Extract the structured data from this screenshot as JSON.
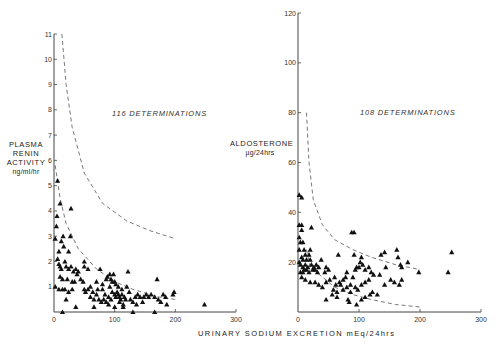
{
  "chart_data": [
    {
      "type": "scatter",
      "title": "",
      "annotation": "116 DETERMINATIONS",
      "xlabel": "URINARY SODIUM EXCRETION mEq/24hrs",
      "ylabel": "PLASMA RENIN ACTIVITY",
      "ylabel_units": "ng/ml/hr",
      "xlim": [
        0,
        300
      ],
      "ylim": [
        0,
        11
      ],
      "xticks": [
        0,
        100,
        200,
        300
      ],
      "yticks": [
        1,
        2,
        3,
        4,
        5,
        6,
        7,
        8,
        9,
        10,
        11
      ],
      "grid": false,
      "marker": "triangle",
      "reference_curves": [
        {
          "name": "upper limit (dashed)",
          "points": [
            [
              13,
              11
            ],
            [
              20,
              9
            ],
            [
              30,
              7.3
            ],
            [
              50,
              5.5
            ],
            [
              80,
              4.3
            ],
            [
              120,
              3.6
            ],
            [
              160,
              3.2
            ],
            [
              200,
              2.9
            ]
          ]
        },
        {
          "name": "lower limit (dashed)",
          "points": [
            [
              2,
              5.8
            ],
            [
              10,
              4.5
            ],
            [
              20,
              3.5
            ],
            [
              40,
              2.5
            ],
            [
              70,
              1.7
            ],
            [
              100,
              1.2
            ],
            [
              130,
              0.9
            ],
            [
              170,
              0.6
            ],
            [
              200,
              0.5
            ]
          ]
        }
      ],
      "series": [
        {
          "name": "determinations",
          "points": [
            [
              6,
              5.2
            ],
            [
              10,
              4.3
            ],
            [
              5,
              3.8
            ],
            [
              28,
              4.1
            ],
            [
              4,
              3.4
            ],
            [
              2,
              2.9
            ],
            [
              15,
              3.0
            ],
            [
              27,
              3.0
            ],
            [
              12,
              2.8
            ],
            [
              16,
              2.6
            ],
            [
              8,
              2.4
            ],
            [
              24,
              2.4
            ],
            [
              6,
              2.1
            ],
            [
              8,
              1.9
            ],
            [
              10,
              1.8
            ],
            [
              12,
              1.7
            ],
            [
              18,
              2.0
            ],
            [
              20,
              1.8
            ],
            [
              24,
              1.7
            ],
            [
              28,
              1.8
            ],
            [
              32,
              1.6
            ],
            [
              36,
              1.7
            ],
            [
              40,
              1.6
            ],
            [
              50,
              2.0
            ],
            [
              50,
              1.8
            ],
            [
              56,
              1.7
            ],
            [
              76,
              1.7
            ],
            [
              122,
              1.6
            ],
            [
              170,
              1.3
            ],
            [
              10,
              1.4
            ],
            [
              14,
              1.3
            ],
            [
              22,
              1.3
            ],
            [
              30,
              1.2
            ],
            [
              34,
              1.2
            ],
            [
              48,
              1.2
            ],
            [
              70,
              1.2
            ],
            [
              80,
              1.1
            ],
            [
              88,
              1.4
            ],
            [
              92,
              1.5
            ],
            [
              94,
              1.3
            ],
            [
              96,
              1.2
            ],
            [
              98,
              1.5
            ],
            [
              100,
              1.2
            ],
            [
              102,
              1.1
            ],
            [
              92,
              1.0
            ],
            [
              86,
              1.3
            ],
            [
              120,
              1.0
            ],
            [
              2,
              1.0
            ],
            [
              8,
              0.9
            ],
            [
              14,
              0.9
            ],
            [
              18,
              0.9
            ],
            [
              24,
              0.8
            ],
            [
              30,
              0.9
            ],
            [
              50,
              0.9
            ],
            [
              52,
              0.8
            ],
            [
              56,
              0.9
            ],
            [
              64,
              0.8
            ],
            [
              70,
              0.7
            ],
            [
              80,
              0.9
            ],
            [
              84,
              0.7
            ],
            [
              90,
              0.6
            ],
            [
              96,
              0.8
            ],
            [
              100,
              0.7
            ],
            [
              102,
              0.6
            ],
            [
              104,
              0.8
            ],
            [
              106,
              0.7
            ],
            [
              108,
              0.6
            ],
            [
              110,
              0.5
            ],
            [
              112,
              0.7
            ],
            [
              116,
              0.6
            ],
            [
              118,
              0.5
            ],
            [
              124,
              0.8
            ],
            [
              126,
              0.5
            ],
            [
              134,
              0.6
            ],
            [
              138,
              0.7
            ],
            [
              142,
              0.6
            ],
            [
              148,
              0.6
            ],
            [
              152,
              0.7
            ],
            [
              156,
              0.6
            ],
            [
              160,
              0.7
            ],
            [
              166,
              0.6
            ],
            [
              172,
              0.5
            ],
            [
              180,
              0.7
            ],
            [
              184,
              0.6
            ],
            [
              196,
              0.7
            ],
            [
              198,
              0.8
            ],
            [
              60,
              0.6
            ],
            [
              66,
              0.5
            ],
            [
              74,
              0.5
            ],
            [
              78,
              0.4
            ],
            [
              86,
              0.4
            ],
            [
              94,
              0.5
            ],
            [
              108,
              0.4
            ],
            [
              114,
              0.3
            ],
            [
              130,
              0.4
            ],
            [
              146,
              0.4
            ],
            [
              176,
              0.4
            ],
            [
              20,
              0.5
            ],
            [
              36,
              0.2
            ],
            [
              66,
              0.2
            ],
            [
              90,
              0.3
            ],
            [
              100,
              0.2
            ],
            [
              114,
              0.2
            ],
            [
              136,
              0.3
            ],
            [
              186,
              0.3
            ],
            [
              248,
              0.3
            ],
            [
              14,
              0.0
            ],
            [
              130,
              0.0
            ],
            [
              166,
              0.0
            ],
            [
              82,
              0.5
            ],
            [
              72,
              0.9
            ],
            [
              60,
              1.0
            ],
            [
              44,
              1.3
            ],
            [
              38,
              1.5
            ],
            [
              106,
              1.0
            ],
            [
              112,
              0.9
            ]
          ]
        }
      ]
    },
    {
      "type": "scatter",
      "title": "",
      "annotation": "108 DETERMINATIONS",
      "xlabel": "URINARY SODIUM EXCRETION mEq/24hrs",
      "ylabel": "ALDOSTERONE",
      "ylabel_units": "µg/24hrs",
      "xlim": [
        0,
        300
      ],
      "ylim": [
        0,
        120
      ],
      "xticks": [
        0,
        100,
        200,
        300
      ],
      "yticks": [
        20,
        40,
        60,
        80,
        100,
        120
      ],
      "grid": false,
      "marker": "triangle",
      "reference_curves": [
        {
          "name": "upper limit (dashed)",
          "points": [
            [
              14,
              80
            ],
            [
              18,
              60
            ],
            [
              25,
              45
            ],
            [
              40,
              35
            ],
            [
              60,
              29
            ],
            [
              90,
              25
            ],
            [
              120,
              22
            ],
            [
              160,
              19
            ],
            [
              200,
              17
            ]
          ]
        },
        {
          "name": "lower limit (dashed)",
          "points": [
            [
              14,
              25
            ],
            [
              20,
              18
            ],
            [
              40,
              14
            ],
            [
              60,
              10
            ],
            [
              90,
              7
            ],
            [
              120,
              5
            ],
            [
              160,
              3
            ],
            [
              200,
              2
            ]
          ]
        }
      ],
      "series": [
        {
          "name": "determinations",
          "points": [
            [
              2,
              47
            ],
            [
              6,
              46
            ],
            [
              2,
              35
            ],
            [
              6,
              35
            ],
            [
              6,
              33
            ],
            [
              22,
              34
            ],
            [
              2,
              30
            ],
            [
              4,
              28
            ],
            [
              8,
              28
            ],
            [
              2,
              25
            ],
            [
              10,
              25
            ],
            [
              20,
              25
            ],
            [
              12,
              23
            ],
            [
              18,
              23
            ],
            [
              6,
              22
            ],
            [
              8,
              21
            ],
            [
              14,
              21
            ],
            [
              20,
              21
            ],
            [
              2,
              20
            ],
            [
              4,
              19
            ],
            [
              8,
              18
            ],
            [
              12,
              19
            ],
            [
              16,
              18
            ],
            [
              22,
              19
            ],
            [
              26,
              18
            ],
            [
              30,
              19
            ],
            [
              34,
              18
            ],
            [
              38,
              21
            ],
            [
              4,
              16
            ],
            [
              8,
              16
            ],
            [
              10,
              17
            ],
            [
              14,
              17
            ],
            [
              18,
              16
            ],
            [
              24,
              17
            ],
            [
              28,
              17
            ],
            [
              32,
              16
            ],
            [
              46,
              18
            ],
            [
              44,
              16
            ],
            [
              50,
              17
            ],
            [
              6,
              14
            ],
            [
              12,
              13
            ],
            [
              20,
              12
            ],
            [
              28,
              12
            ],
            [
              34,
              11
            ],
            [
              40,
              10
            ],
            [
              46,
              12
            ],
            [
              52,
              13
            ],
            [
              60,
              14
            ],
            [
              62,
              11
            ],
            [
              68,
              12
            ],
            [
              74,
              13
            ],
            [
              78,
              14
            ],
            [
              80,
              16
            ],
            [
              86,
              11
            ],
            [
              90,
              14
            ],
            [
              94,
              17
            ],
            [
              96,
              18
            ],
            [
              100,
              18
            ],
            [
              102,
              20
            ],
            [
              106,
              19
            ],
            [
              110,
              17
            ],
            [
              116,
              18
            ],
            [
              66,
              23
            ],
            [
              88,
              32
            ],
            [
              92,
              32
            ],
            [
              92,
              23
            ],
            [
              104,
              22
            ],
            [
              136,
              23
            ],
            [
              142,
              24
            ],
            [
              162,
              25
            ],
            [
              164,
              22
            ],
            [
              168,
              19
            ],
            [
              170,
              18
            ],
            [
              180,
              20
            ],
            [
              198,
              16
            ],
            [
              252,
              24
            ],
            [
              246,
              16
            ],
            [
              144,
              18
            ],
            [
              134,
              15
            ],
            [
              152,
              13
            ],
            [
              158,
              12
            ],
            [
              166,
              11
            ],
            [
              170,
              13
            ],
            [
              142,
              11
            ],
            [
              120,
              16
            ],
            [
              124,
              15
            ],
            [
              116,
              13
            ],
            [
              110,
              12
            ],
            [
              104,
              11
            ],
            [
              98,
              9
            ],
            [
              94,
              10
            ],
            [
              86,
              8
            ],
            [
              80,
              10
            ],
            [
              74,
              9
            ],
            [
              70,
              11
            ],
            [
              64,
              8
            ],
            [
              58,
              9
            ],
            [
              56,
              7
            ],
            [
              46,
              5
            ],
            [
              64,
              6
            ],
            [
              82,
              5
            ],
            [
              84,
              4
            ],
            [
              96,
              3
            ],
            [
              104,
              5
            ],
            [
              110,
              6
            ],
            [
              118,
              7
            ],
            [
              122,
              8
            ],
            [
              130,
              7
            ]
          ]
        }
      ]
    }
  ],
  "left": {
    "ylabel_lines": [
      "PLASMA",
      "RENIN",
      "ACTIVITY"
    ],
    "ylabel_units": "ng/ml/hr",
    "annotation": "116 DETERMINATIONS",
    "yticks": [
      "1",
      "2",
      "3",
      "4",
      "5",
      "6",
      "7",
      "8",
      "9",
      "10",
      "11"
    ],
    "xticks": [
      "0",
      "100",
      "200",
      "300"
    ]
  },
  "right": {
    "ylabel_lines": [
      "ALDOSTERONE"
    ],
    "ylabel_units": "µg/24hrs",
    "annotation": "108 DETERMINATIONS",
    "yticks": [
      "20",
      "40",
      "60",
      "80",
      "100",
      "120"
    ],
    "xticks": [
      "0",
      "100",
      "200",
      "300"
    ]
  },
  "shared": {
    "xlabel": "URINARY SODIUM EXCRETION mEq/24hrs"
  },
  "colors": {
    "ink": "#111111",
    "axis": "#444444",
    "dash": "#555555",
    "background": "#ffffff"
  }
}
